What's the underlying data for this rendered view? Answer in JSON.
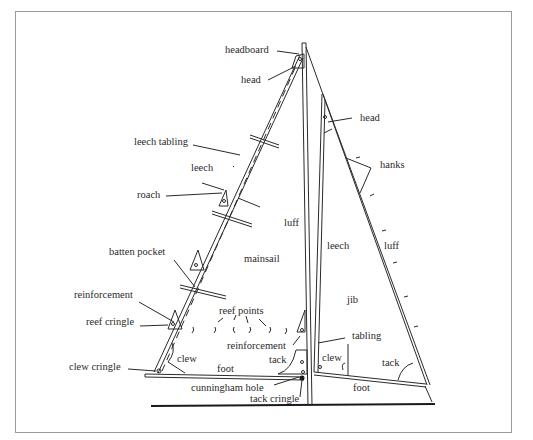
{
  "diagram": {
    "mainsail_labels": {
      "headboard": "headboard",
      "head": "head",
      "leech_tabling": "leech tabling",
      "leech": "leech",
      "roach": "roach",
      "luff": "luff",
      "mainsail": "mainsail",
      "batten_pocket": "batten pocket",
      "reinforcement_left": "reinforcement",
      "reef_cringle": "reef cringle",
      "reef_points": "reef points",
      "reinforcement_right": "reinforcement",
      "clew": "clew",
      "tack": "tack",
      "foot": "foot",
      "clew_cringle": "clew cringle",
      "cunningham_hole": "cunningham hole",
      "tack_cringle": "tack cringle"
    },
    "jib_labels": {
      "head": "head",
      "hanks": "hanks",
      "leech": "leech",
      "luff": "luff",
      "jib": "jib",
      "tabling": "tabling",
      "clew": "clew",
      "tack": "tack",
      "foot": "foot"
    },
    "colors": {
      "line": "#2a2a2a",
      "frame": "#9a9a9a",
      "background": "#ffffff"
    }
  }
}
